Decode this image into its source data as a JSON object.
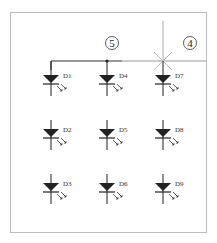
{
  "diagram": {
    "frame": {
      "x": 10,
      "y": 12,
      "width": 197,
      "height": 221,
      "stroke": "#bbbbbb"
    },
    "wire_color": "#333333",
    "highlight_line_color": "#aaaaaa",
    "callouts": [
      {
        "id": "callout-5",
        "label": "5",
        "x": 112,
        "y": 44
      },
      {
        "id": "callout-4",
        "label": "4",
        "x": 190,
        "y": 44
      }
    ],
    "cut_marker": {
      "x": 163,
      "y": 61
    },
    "diodes": [
      {
        "label": "D1",
        "col": 0,
        "row": 0
      },
      {
        "label": "D2",
        "col": 0,
        "row": 1
      },
      {
        "label": "D3",
        "col": 0,
        "row": 2
      },
      {
        "label": "D4",
        "col": 1,
        "row": 0
      },
      {
        "label": "D5",
        "col": 1,
        "row": 1
      },
      {
        "label": "D6",
        "col": 1,
        "row": 2
      },
      {
        "label": "D7",
        "col": 2,
        "row": 0
      },
      {
        "label": "D8",
        "col": 2,
        "row": 1
      },
      {
        "label": "D9",
        "col": 2,
        "row": 2
      }
    ]
  }
}
